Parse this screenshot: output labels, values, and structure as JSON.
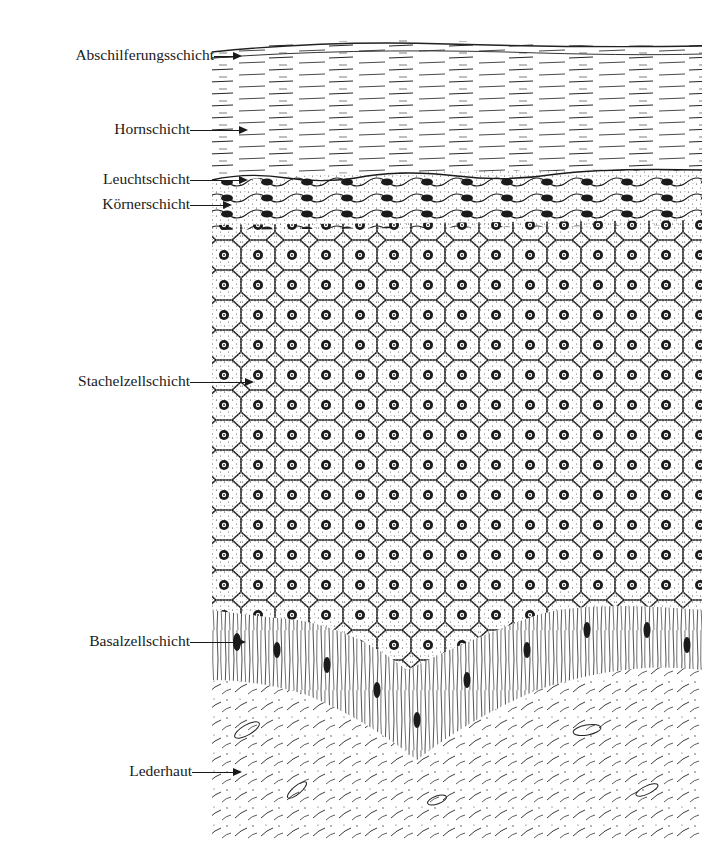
{
  "figure": {
    "palette": {
      "ink": "#1a1a1a",
      "paper": "#ffffff"
    }
  },
  "labels": [
    {
      "id": "abschilferungsschicht",
      "text": "Abschilferungsschicht",
      "y": 55,
      "arrow_from": 213,
      "arrow_to": 240
    },
    {
      "id": "hornschicht",
      "text": "Hornschicht",
      "y": 129,
      "arrow_from": 190,
      "arrow_to": 246
    },
    {
      "id": "leuchtschicht",
      "text": "Leuchtschicht",
      "y": 179,
      "arrow_from": 190,
      "arrow_to": 246
    },
    {
      "id": "koernerschicht",
      "text": "Körnerschicht",
      "y": 204,
      "arrow_from": 190,
      "arrow_to": 230
    },
    {
      "id": "stachelzellschicht",
      "text": "Stachelzellschicht",
      "y": 381,
      "arrow_from": 190,
      "arrow_to": 252
    },
    {
      "id": "basalzellschicht",
      "text": "Basalzellschicht",
      "y": 641,
      "arrow_from": 190,
      "arrow_to": 244
    },
    {
      "id": "lederhaut",
      "text": "Lederhaut",
      "y": 771,
      "arrow_from": 192,
      "arrow_to": 240
    }
  ]
}
